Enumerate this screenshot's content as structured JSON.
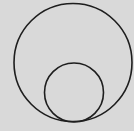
{
  "diagram": {
    "background": "#d9d9d9",
    "stroke_color": "#1e1e1e",
    "stroke_width": 1.6,
    "circles": [
      {
        "name": "outer-circle",
        "cx": 73,
        "cy": 62.5,
        "r": 59
      },
      {
        "name": "inner-circle",
        "cx": 74,
        "cy": 92.5,
        "r": 29.5
      }
    ],
    "relation": "internally tangent at bottom"
  }
}
